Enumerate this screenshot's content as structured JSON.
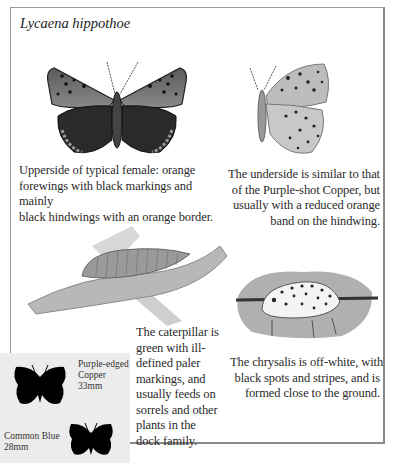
{
  "page": {
    "title": "Lycaena hippothoe"
  },
  "captions": {
    "upperside": "Upperside of typical female: orange forewings with black markings and mainly black hindwings with an orange border.",
    "underside": "The underside is similar to that of the Purple-shot Copper, but usually with a reduced orange band on the hindwing.",
    "caterpillar": "The caterpillar is green with ill-defined paler markings, and usually feeds on sorrels and other plants in the dock family.",
    "chrysalis": "The chrysalis is off-white, with black spots and stripes, and is formed close to the ground."
  },
  "caption_lines": {
    "upperside": [
      "Upperside of typical female: orange",
      "forewings with black markings and mainly",
      "black hindwings with an orange border."
    ],
    "underside": [
      "The underside is similar to that",
      "of the Purple-shot Copper, but",
      "usually with a reduced orange",
      "band on the hindwing."
    ],
    "caterpillar": [
      "The caterpillar is",
      "green with ill-",
      "defined paler",
      "markings, and",
      "usually feeds on",
      "sorrels and other",
      "plants in the",
      "dock family."
    ],
    "chrysalis": [
      "The chrysalis is off-white, with",
      "black spots and stripes, and is",
      "formed close to the ground."
    ]
  },
  "illustrations": [
    {
      "name": "butterfly-upperside-illustration",
      "subject": "Upperside of female butterfly"
    },
    {
      "name": "butterfly-underside-illustration",
      "subject": "Underside of butterfly"
    },
    {
      "name": "caterpillar-illustration",
      "subject": "Caterpillar on leaf"
    },
    {
      "name": "chrysalis-illustration",
      "subject": "Spotted chrysalis"
    }
  ],
  "size_comparison": {
    "species": [
      {
        "name_lines": [
          "Purple-edged",
          "Copper"
        ],
        "size": "33mm"
      },
      {
        "name_lines": [
          "Common Blue"
        ],
        "size": "28mm"
      }
    ]
  },
  "colors": {
    "frame_border": "#9a9a9a",
    "size_box_bg": "#ececec",
    "text": "#2a2a2a"
  }
}
